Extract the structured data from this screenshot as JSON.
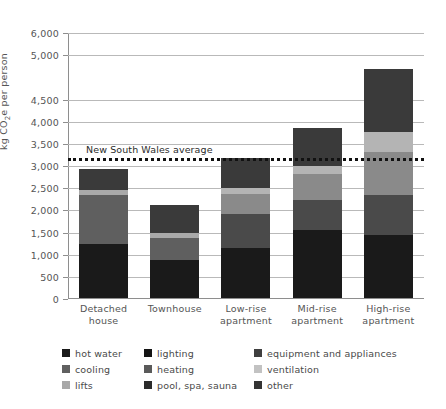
{
  "chart_data": {
    "type": "bar",
    "subtype": "stacked-bar",
    "title": "",
    "xlabel": "",
    "ylabel": "kg CO2e per person",
    "ylabel_html": "kg CO₂e per person",
    "ylim": [
      0,
      6000
    ],
    "grid": true,
    "legend_position": "bottom",
    "categories": [
      "Detached house",
      "Townhouse",
      "Low-rise apartment",
      "Mid-rise apartment",
      "High-rise apartment"
    ],
    "category_lines": [
      [
        "Detached",
        "house"
      ],
      [
        "Townhouse",
        ""
      ],
      [
        "Low-rise",
        "apartment"
      ],
      [
        "Mid-rise",
        "apartment"
      ],
      [
        "High-rise",
        "apartment"
      ]
    ],
    "ytick_labels": [
      "0",
      "500",
      "1,000",
      "1,500",
      "2,000",
      "2,500",
      "3,000",
      "3,500",
      "4,000",
      "4,500",
      "5,000",
      "6,000"
    ],
    "ytick_values": [
      0,
      500,
      1000,
      1500,
      2000,
      2500,
      3000,
      3500,
      4000,
      4500,
      5500,
      6000
    ],
    "series": [
      {
        "name": "hot water",
        "color": "#1c1c1c",
        "values": [
          1240,
          890,
          1160,
          1560,
          1440
        ]
      },
      {
        "name": "lighting",
        "color": "#161616",
        "values": [
          0,
          0,
          0,
          0,
          0
        ]
      },
      {
        "name": "equipment and appliances",
        "color": "#3b3b3b",
        "values": [
          580,
          0,
          0,
          670,
          900
        ]
      },
      {
        "name": "cooling",
        "color": "#6f6f6f",
        "values": [
          0,
          490,
          760,
          510,
          1000
        ]
      },
      {
        "name": "heating",
        "color": "#6f6f6f",
        "values": [
          510,
          0,
          0,
          0,
          0
        ]
      },
      {
        "name": "ventilation",
        "color": "#bcbcbc",
        "values": [
          20,
          120,
          130,
          140,
          380
        ]
      },
      {
        "name": "lifts",
        "color": "#9d9d9d",
        "values": [
          0,
          0,
          340,
          290,
          340
        ]
      },
      {
        "name": "pool, spa, sauna",
        "color": "#2a2a2a",
        "values": [
          0,
          0,
          0,
          0,
          0
        ]
      },
      {
        "name": "other",
        "color": "#333333",
        "values": [
          580,
          630,
          800,
          1120,
          1800
        ]
      }
    ],
    "totals": [
      2930,
      2130,
      3190,
      3860,
      5180
    ],
    "stacks": [
      {
        "category": "Detached house",
        "segments": [
          {
            "name": "hot water",
            "color": "#1a1a1a",
            "value": 1240
          },
          {
            "name": "heating",
            "color": "#5f5f5f",
            "value": 1100
          },
          {
            "name": "ventilation",
            "color": "#a9a9a9",
            "value": 110
          },
          {
            "name": "other",
            "color": "#3a3a3a",
            "value": 480
          }
        ]
      },
      {
        "category": "Townhouse",
        "segments": [
          {
            "name": "hot water",
            "color": "#1a1a1a",
            "value": 890
          },
          {
            "name": "heating",
            "color": "#5f5f5f",
            "value": 490
          },
          {
            "name": "ventilation",
            "color": "#a9a9a9",
            "value": 120
          },
          {
            "name": "other",
            "color": "#3a3a3a",
            "value": 630
          }
        ]
      },
      {
        "category": "Low-rise apartment",
        "segments": [
          {
            "name": "hot water",
            "color": "#1a1a1a",
            "value": 1160
          },
          {
            "name": "cooling",
            "color": "#4a4a4a",
            "value": 760
          },
          {
            "name": "lifts",
            "color": "#8a8a8a",
            "value": 460
          },
          {
            "name": "ventilation",
            "color": "#b4b4b4",
            "value": 130
          },
          {
            "name": "other",
            "color": "#3a3a3a",
            "value": 680
          }
        ]
      },
      {
        "category": "Mid-rise apartment",
        "segments": [
          {
            "name": "hot water",
            "color": "#1a1a1a",
            "value": 1560
          },
          {
            "name": "cooling",
            "color": "#4a4a4a",
            "value": 680
          },
          {
            "name": "lifts",
            "color": "#8a8a8a",
            "value": 580
          },
          {
            "name": "ventilation",
            "color": "#b4b4b4",
            "value": 180
          },
          {
            "name": "other",
            "color": "#3a3a3a",
            "value": 860
          }
        ]
      },
      {
        "category": "High-rise apartment",
        "segments": [
          {
            "name": "hot water",
            "color": "#1a1a1a",
            "value": 1440
          },
          {
            "name": "cooling",
            "color": "#4a4a4a",
            "value": 900
          },
          {
            "name": "lifts",
            "color": "#8a8a8a",
            "value": 980
          },
          {
            "name": "ventilation",
            "color": "#b4b4b4",
            "value": 440
          },
          {
            "name": "other",
            "color": "#3a3a3a",
            "value": 1420
          }
        ]
      }
    ],
    "annotations": [
      {
        "name": "new-south-wales-average",
        "label": "New South Wales average",
        "value": 3180,
        "style": "dotted",
        "color": "#111111"
      }
    ]
  },
  "legend": {
    "items": [
      {
        "label": "hot water",
        "color": "#1a1a1a"
      },
      {
        "label": "lighting",
        "color": "#141414"
      },
      {
        "label": "equipment and appliances",
        "color": "#3f3f3f"
      },
      {
        "label": "cooling",
        "color": "#606060"
      },
      {
        "label": "heating",
        "color": "#5a5a5a"
      },
      {
        "label": "ventilation",
        "color": "#c2c2c2"
      },
      {
        "label": "lifts",
        "color": "#a8a8a8"
      },
      {
        "label": "pool, spa, sauna",
        "color": "#2b2b2b"
      },
      {
        "label": "other",
        "color": "#343434"
      }
    ]
  }
}
